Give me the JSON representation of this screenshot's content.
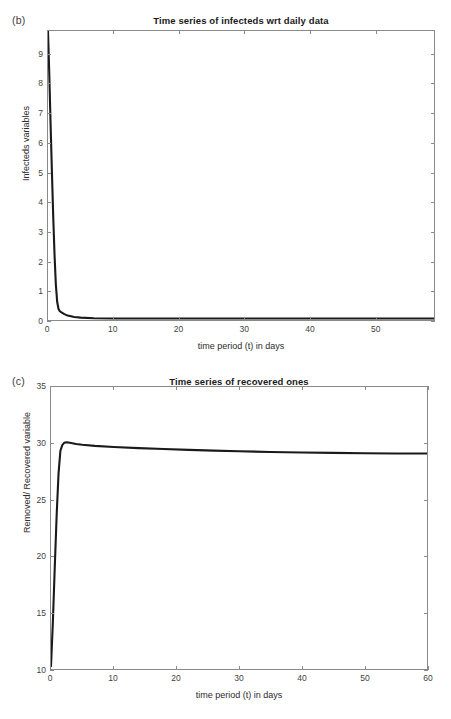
{
  "figure": {
    "background_color": "#ffffff",
    "line_color": "#1a1a1a",
    "axis_color": "#8a8a8a"
  },
  "panels": [
    {
      "letter": "(b)",
      "title": "Time series of infecteds wrt daily data",
      "xlabel": "time period (t) in days",
      "ylabel": "Infecteds variables",
      "xticks": [
        "0",
        "10",
        "20",
        "30",
        "40",
        "50"
      ],
      "yticks": [
        "0",
        "1",
        "2",
        "3",
        "4",
        "5",
        "6",
        "7",
        "8",
        "9"
      ]
    },
    {
      "letter": "(c)",
      "title": "Time series of recovered ones",
      "xlabel": "time period (t) in days",
      "ylabel": "Removed/ Recovered variable",
      "xticks": [
        "0",
        "10",
        "20",
        "30",
        "40",
        "50",
        "60"
      ],
      "yticks": [
        "10",
        "15",
        "20",
        "25",
        "30",
        "35"
      ]
    }
  ],
  "chart_data": [
    {
      "type": "line",
      "panel": "(b)",
      "title": "Time series of infecteds wrt daily data",
      "xlabel": "time period (t) in days",
      "ylabel": "Infecteds variables",
      "xlim": [
        0,
        59
      ],
      "ylim": [
        0,
        9.8
      ],
      "xticks": [
        0,
        10,
        20,
        30,
        40,
        50
      ],
      "yticks": [
        0,
        1,
        2,
        3,
        4,
        5,
        6,
        7,
        8,
        9
      ],
      "grid": false,
      "legend": "none",
      "series": [
        {
          "name": "Infecteds",
          "x": [
            0,
            0.2,
            0.4,
            0.6,
            0.8,
            1.0,
            1.2,
            1.4,
            1.6,
            1.8,
            2.0,
            2.5,
            3.0,
            4.0,
            5.0,
            7.0,
            10,
            15,
            20,
            25,
            30,
            35,
            40,
            45,
            50,
            55,
            59
          ],
          "y": [
            9.8,
            8.3,
            6.6,
            5.0,
            3.5,
            2.2,
            1.2,
            0.62,
            0.38,
            0.3,
            0.27,
            0.2,
            0.15,
            0.1,
            0.08,
            0.06,
            0.05,
            0.05,
            0.05,
            0.05,
            0.05,
            0.05,
            0.05,
            0.05,
            0.05,
            0.05,
            0.05
          ]
        }
      ]
    },
    {
      "type": "line",
      "panel": "(c)",
      "title": "Time series of recovered ones",
      "xlabel": "time period (t) in days",
      "ylabel": "Removed/ Recovered variable",
      "xlim": [
        0,
        60
      ],
      "ylim": [
        10,
        35
      ],
      "xticks": [
        0,
        10,
        20,
        30,
        40,
        50,
        60
      ],
      "yticks": [
        10,
        15,
        20,
        25,
        30,
        35
      ],
      "grid": false,
      "legend": "none",
      "series": [
        {
          "name": "Removed/Recovered",
          "x": [
            0,
            0.3,
            0.6,
            0.9,
            1.2,
            1.5,
            1.8,
            2.1,
            2.5,
            3.0,
            4.0,
            5.0,
            7.0,
            10,
            14,
            18,
            22,
            26,
            30,
            35,
            40,
            45,
            50,
            55,
            60
          ],
          "y": [
            10.25,
            14.2,
            19.0,
            23.6,
            27.3,
            29.35,
            29.85,
            30.05,
            30.1,
            30.05,
            29.95,
            29.88,
            29.78,
            29.68,
            29.58,
            29.5,
            29.43,
            29.36,
            29.3,
            29.24,
            29.2,
            29.16,
            29.13,
            29.11,
            29.1
          ]
        }
      ]
    }
  ]
}
